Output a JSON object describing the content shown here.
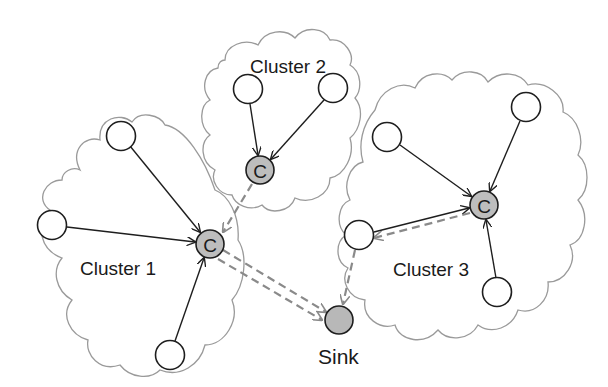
{
  "diagram": {
    "type": "clustered-network",
    "colors": {
      "cloud_stroke": "#9a9a9a",
      "node_stroke": "#1e1e1e",
      "head_fill": "#bdbdbd",
      "sink_fill": "#b8b8b8",
      "dashed_link": "#8a8a8a"
    },
    "clusters": [
      {
        "id": "cluster1",
        "label": "Cluster 1",
        "head_label": "C"
      },
      {
        "id": "cluster2",
        "label": "Cluster 2",
        "head_label": "C"
      },
      {
        "id": "cluster3",
        "label": "Cluster 3",
        "head_label": "C"
      }
    ],
    "sink": {
      "label": "Sink"
    },
    "edges": {
      "intra_cluster": "member → cluster head (solid arrows)",
      "inter_cluster": [
        "Cluster 2 head → Cluster 1 head (dashed)",
        "Cluster 1 head → Sink (double dashed)",
        "Cluster 3 head → Cluster 3 member → Sink (dashed)"
      ]
    }
  }
}
